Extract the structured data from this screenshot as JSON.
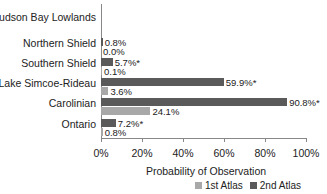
{
  "chart_data": {
    "type": "bar",
    "orientation": "horizontal",
    "title": "",
    "xlabel": "Probability of Observation",
    "ylabel": "",
    "xlim": [
      0,
      100
    ],
    "x_ticks": [
      "0%",
      "20%",
      "40%",
      "60%",
      "80%",
      "100%"
    ],
    "categories": [
      "Hudson Bay Lowlands",
      "Northern Shield",
      "Southern Shield",
      "Lake Simcoe-Rideau",
      "Carolinian",
      "Ontario"
    ],
    "series": [
      {
        "name": "2nd Atlas",
        "color": "#5a5a5a",
        "values": [
          null,
          0.8,
          5.7,
          59.9,
          90.8,
          7.2
        ],
        "labels": [
          "",
          "0.8%",
          "5.7%*",
          "59.9%*",
          "90.8%*",
          "7.2%*"
        ]
      },
      {
        "name": "1st Atlas",
        "color": "#a8a8a8",
        "values": [
          null,
          0.0,
          0.1,
          3.6,
          24.1,
          0.8
        ],
        "labels": [
          "",
          "0.0%",
          "0.1%",
          "3.6%",
          "24.1%",
          "0.8%"
        ]
      }
    ],
    "legend": {
      "position": "bottom",
      "entries": [
        "1st Atlas",
        "2nd Atlas"
      ]
    },
    "grid": false
  }
}
